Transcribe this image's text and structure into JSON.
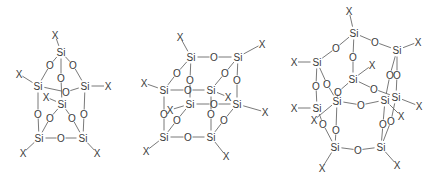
{
  "figure": {
    "colors": {
      "line": "#6a6a6a",
      "text": "#3a3a3a",
      "background": "#ffffff"
    },
    "molecules": [
      {
        "id": "T6",
        "atoms": [
          {
            "id": "s1",
            "el": "Si",
            "x": 61,
            "y": 52
          },
          {
            "id": "s2",
            "el": "Si",
            "x": 38,
            "y": 86
          },
          {
            "id": "s3",
            "el": "Si",
            "x": 85,
            "y": 86
          },
          {
            "id": "s4",
            "el": "Si",
            "x": 62,
            "y": 104
          },
          {
            "id": "s5",
            "el": "Si",
            "x": 39,
            "y": 138
          },
          {
            "id": "s6",
            "el": "Si",
            "x": 83,
            "y": 138
          },
          {
            "id": "o1",
            "el": "O",
            "x": 50,
            "y": 65
          },
          {
            "id": "o2",
            "el": "O",
            "x": 73,
            "y": 65
          },
          {
            "id": "o3",
            "el": "O",
            "x": 61,
            "y": 78
          },
          {
            "id": "o4",
            "el": "O",
            "x": 66,
            "y": 92
          },
          {
            "id": "o5",
            "el": "O",
            "x": 38,
            "y": 114
          },
          {
            "id": "o6",
            "el": "O",
            "x": 84,
            "y": 114
          },
          {
            "id": "o7",
            "el": "O",
            "x": 50,
            "y": 118
          },
          {
            "id": "o8",
            "el": "O",
            "x": 72,
            "y": 118
          },
          {
            "id": "o9",
            "el": "O",
            "x": 61,
            "y": 138
          },
          {
            "id": "x1",
            "el": "X",
            "x": 55,
            "y": 35
          },
          {
            "id": "x2",
            "el": "X",
            "x": 19,
            "y": 74
          },
          {
            "id": "x3",
            "el": "X",
            "x": 108,
            "y": 86
          },
          {
            "id": "x4",
            "el": "X",
            "x": 46,
            "y": 97
          },
          {
            "id": "x5",
            "el": "X",
            "x": 23,
            "y": 153
          },
          {
            "id": "x6",
            "el": "X",
            "x": 97,
            "y": 153
          }
        ],
        "bonds": [
          [
            "s1",
            "x1"
          ],
          [
            "s1",
            "o1"
          ],
          [
            "o1",
            "s2"
          ],
          [
            "s1",
            "o2"
          ],
          [
            "o2",
            "s3"
          ],
          [
            "s1",
            "o3"
          ],
          [
            "o3",
            "s4"
          ],
          [
            "s2",
            "o4"
          ],
          [
            "o4",
            "s3"
          ],
          [
            "s2",
            "x2"
          ],
          [
            "s3",
            "x3"
          ],
          [
            "s4",
            "x4"
          ],
          [
            "s2",
            "o5"
          ],
          [
            "o5",
            "s5"
          ],
          [
            "s3",
            "o6"
          ],
          [
            "o6",
            "s6"
          ],
          [
            "s4",
            "o7"
          ],
          [
            "o7",
            "s5"
          ],
          [
            "s4",
            "o8"
          ],
          [
            "o8",
            "s6"
          ],
          [
            "s5",
            "o9"
          ],
          [
            "o9",
            "s6"
          ],
          [
            "s5",
            "x5"
          ],
          [
            "s6",
            "x6"
          ]
        ]
      },
      {
        "id": "T8",
        "atoms": [
          {
            "id": "a",
            "el": "Si",
            "x": 191,
            "y": 57
          },
          {
            "id": "b",
            "el": "Si",
            "x": 238,
            "y": 57
          },
          {
            "id": "c",
            "el": "Si",
            "x": 164,
            "y": 90
          },
          {
            "id": "d",
            "el": "Si",
            "x": 211,
            "y": 90
          },
          {
            "id": "e",
            "el": "Si",
            "x": 190,
            "y": 104
          },
          {
            "id": "f",
            "el": "Si",
            "x": 237,
            "y": 104
          },
          {
            "id": "g",
            "el": "Si",
            "x": 164,
            "y": 137
          },
          {
            "id": "h",
            "el": "Si",
            "x": 211,
            "y": 137
          },
          {
            "id": "o1",
            "el": "O",
            "x": 214,
            "y": 57
          },
          {
            "id": "o2",
            "el": "O",
            "x": 177,
            "y": 73
          },
          {
            "id": "o3",
            "el": "O",
            "x": 225,
            "y": 73
          },
          {
            "id": "o4",
            "el": "O",
            "x": 190,
            "y": 80
          },
          {
            "id": "o5",
            "el": "O",
            "x": 237,
            "y": 80
          },
          {
            "id": "o6",
            "el": "O",
            "x": 188,
            "y": 90
          },
          {
            "id": "o7",
            "el": "O",
            "x": 214,
            "y": 104
          },
          {
            "id": "o8",
            "el": "O",
            "x": 164,
            "y": 114
          },
          {
            "id": "o9",
            "el": "O",
            "x": 211,
            "y": 114
          },
          {
            "id": "o10",
            "el": "O",
            "x": 177,
            "y": 120
          },
          {
            "id": "o11",
            "el": "O",
            "x": 224,
            "y": 120
          },
          {
            "id": "o12",
            "el": "O",
            "x": 188,
            "y": 137
          },
          {
            "id": "x1",
            "el": "X",
            "x": 180,
            "y": 37
          },
          {
            "id": "x2",
            "el": "X",
            "x": 262,
            "y": 44
          },
          {
            "id": "x3",
            "el": "X",
            "x": 144,
            "y": 83
          },
          {
            "id": "x4",
            "el": "X",
            "x": 228,
            "y": 97
          },
          {
            "id": "x5",
            "el": "X",
            "x": 170,
            "y": 110
          },
          {
            "id": "x6",
            "el": "X",
            "x": 265,
            "y": 112
          },
          {
            "id": "x7",
            "el": "X",
            "x": 146,
            "y": 151
          },
          {
            "id": "x8",
            "el": "X",
            "x": 226,
            "y": 156
          }
        ],
        "bonds": [
          [
            "a",
            "o1"
          ],
          [
            "o1",
            "b"
          ],
          [
            "a",
            "o2"
          ],
          [
            "o2",
            "c"
          ],
          [
            "b",
            "o3"
          ],
          [
            "o3",
            "d"
          ],
          [
            "a",
            "o4"
          ],
          [
            "o4",
            "e"
          ],
          [
            "b",
            "o5"
          ],
          [
            "o5",
            "f"
          ],
          [
            "c",
            "o6"
          ],
          [
            "o6",
            "d"
          ],
          [
            "e",
            "o7"
          ],
          [
            "o7",
            "f"
          ],
          [
            "c",
            "o8"
          ],
          [
            "o8",
            "g"
          ],
          [
            "d",
            "o9"
          ],
          [
            "o9",
            "h"
          ],
          [
            "e",
            "o10"
          ],
          [
            "o10",
            "g"
          ],
          [
            "f",
            "o11"
          ],
          [
            "o11",
            "h"
          ],
          [
            "g",
            "o12"
          ],
          [
            "o12",
            "h"
          ],
          [
            "a",
            "x1"
          ],
          [
            "b",
            "x2"
          ],
          [
            "c",
            "x3"
          ],
          [
            "d",
            "x4"
          ],
          [
            "e",
            "x5"
          ],
          [
            "f",
            "x6"
          ],
          [
            "g",
            "x7"
          ],
          [
            "h",
            "x8"
          ]
        ]
      },
      {
        "id": "T10",
        "atoms": [
          {
            "id": "a",
            "el": "Si",
            "x": 354,
            "y": 33
          },
          {
            "id": "b",
            "el": "Si",
            "x": 397,
            "y": 50
          },
          {
            "id": "c",
            "el": "Si",
            "x": 317,
            "y": 62
          },
          {
            "id": "d",
            "el": "Si",
            "x": 353,
            "y": 79
          },
          {
            "id": "e",
            "el": "Si",
            "x": 396,
            "y": 97
          },
          {
            "id": "f",
            "el": "Si",
            "x": 317,
            "y": 108
          },
          {
            "id": "g",
            "el": "Si",
            "x": 337,
            "y": 101
          },
          {
            "id": "h",
            "el": "Si",
            "x": 385,
            "y": 100
          },
          {
            "id": "i",
            "el": "Si",
            "x": 335,
            "y": 147
          },
          {
            "id": "j",
            "el": "Si",
            "x": 381,
            "y": 147
          },
          {
            "id": "o1",
            "el": "O",
            "x": 375,
            "y": 42
          },
          {
            "id": "o2",
            "el": "O",
            "x": 336,
            "y": 48
          },
          {
            "id": "o3",
            "el": "O",
            "x": 353,
            "y": 57
          },
          {
            "id": "o4",
            "el": "O",
            "x": 316,
            "y": 86
          },
          {
            "id": "o5",
            "el": "O",
            "x": 327,
            "y": 84
          },
          {
            "id": "o6",
            "el": "O",
            "x": 338,
            "y": 92
          },
          {
            "id": "o7",
            "el": "O",
            "x": 374,
            "y": 89
          },
          {
            "id": "o8",
            "el": "O",
            "x": 390,
            "y": 75
          },
          {
            "id": "o9",
            "el": "O",
            "x": 397,
            "y": 75
          },
          {
            "id": "o10",
            "el": "O",
            "x": 361,
            "y": 105
          },
          {
            "id": "o11",
            "el": "O",
            "x": 323,
            "y": 124
          },
          {
            "id": "o12",
            "el": "O",
            "x": 336,
            "y": 130
          },
          {
            "id": "o13",
            "el": "O",
            "x": 383,
            "y": 124
          },
          {
            "id": "o14",
            "el": "O",
            "x": 391,
            "y": 121
          },
          {
            "id": "o15",
            "el": "O",
            "x": 358,
            "y": 150
          },
          {
            "id": "x1",
            "el": "X",
            "x": 349,
            "y": 11
          },
          {
            "id": "x2",
            "el": "X",
            "x": 418,
            "y": 42
          },
          {
            "id": "x3",
            "el": "X",
            "x": 294,
            "y": 62
          },
          {
            "id": "x4",
            "el": "X",
            "x": 372,
            "y": 65
          },
          {
            "id": "x5",
            "el": "X",
            "x": 419,
            "y": 106
          },
          {
            "id": "x6",
            "el": "X",
            "x": 294,
            "y": 108
          },
          {
            "id": "x7",
            "el": "X",
            "x": 314,
            "y": 120
          },
          {
            "id": "x8",
            "el": "X",
            "x": 401,
            "y": 116
          },
          {
            "id": "x9",
            "el": "X",
            "x": 322,
            "y": 168
          },
          {
            "id": "x10",
            "el": "X",
            "x": 397,
            "y": 165
          }
        ],
        "bonds": [
          [
            "a",
            "o1"
          ],
          [
            "o1",
            "b"
          ],
          [
            "a",
            "o2"
          ],
          [
            "o2",
            "c"
          ],
          [
            "a",
            "o3"
          ],
          [
            "o3",
            "d"
          ],
          [
            "c",
            "o4"
          ],
          [
            "o4",
            "f"
          ],
          [
            "c",
            "o5"
          ],
          [
            "o5",
            "g"
          ],
          [
            "d",
            "o6"
          ],
          [
            "o6",
            "g"
          ],
          [
            "d",
            "o7"
          ],
          [
            "o7",
            "e"
          ],
          [
            "b",
            "o8"
          ],
          [
            "o8",
            "h"
          ],
          [
            "b",
            "o9"
          ],
          [
            "o9",
            "e"
          ],
          [
            "g",
            "o10"
          ],
          [
            "o10",
            "h"
          ],
          [
            "f",
            "o11"
          ],
          [
            "o11",
            "i"
          ],
          [
            "g",
            "o12"
          ],
          [
            "o12",
            "i"
          ],
          [
            "h",
            "o13"
          ],
          [
            "o13",
            "j"
          ],
          [
            "e",
            "o14"
          ],
          [
            "o14",
            "j"
          ],
          [
            "i",
            "o15"
          ],
          [
            "o15",
            "j"
          ],
          [
            "a",
            "x1"
          ],
          [
            "b",
            "x2"
          ],
          [
            "c",
            "x3"
          ],
          [
            "d",
            "x4"
          ],
          [
            "e",
            "x5"
          ],
          [
            "f",
            "x6"
          ],
          [
            "g",
            "x7"
          ],
          [
            "h",
            "x8"
          ],
          [
            "i",
            "x9"
          ],
          [
            "j",
            "x10"
          ]
        ]
      }
    ]
  }
}
